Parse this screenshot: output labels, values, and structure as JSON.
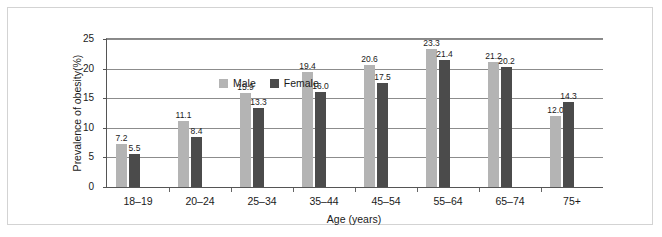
{
  "chart_data": {
    "type": "bar",
    "title": "",
    "xlabel": "Age (years)",
    "ylabel": "Prevalence of obesity(%)",
    "categories": [
      "18–19",
      "20–24",
      "25–34",
      "35–44",
      "45–54",
      "55–64",
      "65–74",
      "75+"
    ],
    "series": [
      {
        "name": "Male",
        "color": "#b4b4b4",
        "values": [
          7.2,
          11.1,
          15.9,
          19.4,
          20.6,
          23.3,
          21.2,
          12.0
        ],
        "labels": [
          "7.2",
          "11.1",
          "15.9",
          "19.4",
          "20.6",
          "23.3",
          "21.2",
          "12.0"
        ]
      },
      {
        "name": "Female",
        "color": "#4b4b4b",
        "values": [
          5.5,
          8.4,
          13.3,
          16.0,
          17.5,
          21.4,
          20.2,
          14.3
        ],
        "labels": [
          "5.5",
          "8.4",
          "13.3",
          "16.0",
          "17.5",
          "21.4",
          "20.2",
          "14.3"
        ]
      }
    ],
    "ylim": [
      0,
      25
    ],
    "yticks": [
      0,
      5,
      10,
      15,
      20,
      25
    ],
    "ytick_labels": [
      "0",
      "5",
      "10",
      "15",
      "20",
      "25"
    ],
    "grid": "horizontal",
    "legend_position": "top-left-inside"
  },
  "legend": {
    "items": [
      {
        "label": "Male",
        "color": "#b4b4b4"
      },
      {
        "label": "Female",
        "color": "#4b4b4b"
      }
    ]
  },
  "colors": {
    "male": "#b4b4b4",
    "female": "#4b4b4b",
    "gridline": "#8c8c8c",
    "axis": "#555555",
    "frame": "#d3d3d3",
    "text": "#1a1a1a",
    "background": "#ffffff"
  }
}
